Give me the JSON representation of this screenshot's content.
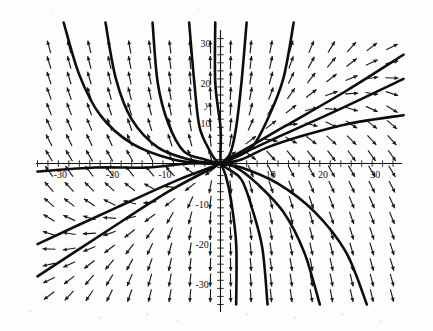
{
  "figure": {
    "kind": "direction-field-plot",
    "axis_name_y": "y",
    "background_color": "#fdfdfc",
    "ink_color": "#111111"
  },
  "chart_data": {
    "type": "scatter",
    "title": "",
    "subtitle": "",
    "xlabel": "",
    "ylabel": "y",
    "xlim": [
      -35,
      35
    ],
    "ylim": [
      -35,
      35
    ],
    "grid": false,
    "legend": null,
    "x_tick_labels": [
      "-30",
      "-20",
      "-10",
      "10",
      "20",
      "30"
    ],
    "x_tick_values": [
      -30,
      -20,
      -10,
      10,
      20,
      30
    ],
    "y_tick_labels": [
      "30",
      "20",
      "10",
      "-10",
      "-20",
      "-30"
    ],
    "y_tick_values": [
      30,
      20,
      10,
      -10,
      -20,
      -30
    ],
    "minor_tick_step": 2,
    "field": {
      "description": "slope field arrows on a regular grid",
      "grid_step_x": 4,
      "grid_step_y": 4,
      "arrow_count_x": 18,
      "arrow_count_y": 18,
      "arrow_length_px": 13
    },
    "equilibrium_points": [
      {
        "x": 0,
        "y": 0,
        "type": "node"
      }
    ],
    "solution_curves": [
      {
        "name": "separatrix-upper-right",
        "points": [
          [
            -35,
            -20
          ],
          [
            -20,
            -11
          ],
          [
            -8,
            -4
          ],
          [
            0,
            0
          ],
          [
            10,
            6
          ],
          [
            22,
            13
          ],
          [
            35,
            21
          ]
        ]
      },
      {
        "name": "separatrix-lower-left",
        "points": [
          [
            -35,
            -28
          ],
          [
            -22,
            -17
          ],
          [
            -10,
            -7
          ],
          [
            0,
            0
          ],
          [
            12,
            9
          ],
          [
            24,
            18
          ],
          [
            35,
            27
          ]
        ]
      },
      {
        "name": "curve-ul-1",
        "points": [
          [
            -30,
            35
          ],
          [
            -27,
            22
          ],
          [
            -23,
            12
          ],
          [
            -17,
            5
          ],
          [
            -9,
            1
          ],
          [
            -2,
            0
          ],
          [
            0,
            0
          ]
        ]
      },
      {
        "name": "curve-ul-2",
        "points": [
          [
            -22,
            35
          ],
          [
            -20,
            21
          ],
          [
            -17,
            11
          ],
          [
            -12,
            4
          ],
          [
            -6,
            1
          ],
          [
            -1,
            0
          ],
          [
            0,
            0
          ]
        ]
      },
      {
        "name": "curve-ul-3",
        "points": [
          [
            -13,
            35
          ],
          [
            -12,
            20
          ],
          [
            -10,
            10
          ],
          [
            -7,
            3
          ],
          [
            -3,
            1
          ],
          [
            0,
            0
          ]
        ]
      },
      {
        "name": "curve-ul-4",
        "points": [
          [
            -6,
            35
          ],
          [
            -5,
            20
          ],
          [
            -4,
            9
          ],
          [
            -2,
            3
          ],
          [
            -1,
            1
          ],
          [
            0,
            0
          ]
        ]
      },
      {
        "name": "curve-u-center",
        "points": [
          [
            -1,
            35
          ],
          [
            -1,
            20
          ],
          [
            0,
            9
          ],
          [
            0,
            3
          ],
          [
            0,
            0
          ]
        ]
      },
      {
        "name": "curve-ur-1",
        "points": [
          [
            5,
            35
          ],
          [
            4,
            20
          ],
          [
            3,
            9
          ],
          [
            2,
            3
          ],
          [
            1,
            1
          ],
          [
            0,
            0
          ]
        ]
      },
      {
        "name": "curve-ur-2",
        "points": [
          [
            14,
            35
          ],
          [
            12,
            21
          ],
          [
            9,
            11
          ],
          [
            6,
            4
          ],
          [
            2,
            1
          ],
          [
            0,
            0
          ]
        ]
      },
      {
        "name": "curve-r-flat",
        "points": [
          [
            35,
            12
          ],
          [
            25,
            10
          ],
          [
            16,
            7
          ],
          [
            9,
            4
          ],
          [
            4,
            1
          ],
          [
            0,
            0
          ]
        ]
      },
      {
        "name": "curve-lr-1",
        "points": [
          [
            3,
            -35
          ],
          [
            3,
            -20
          ],
          [
            2,
            -9
          ],
          [
            1,
            -3
          ],
          [
            0,
            0
          ]
        ]
      },
      {
        "name": "curve-lr-2",
        "points": [
          [
            9,
            -35
          ],
          [
            8,
            -21
          ],
          [
            6,
            -11
          ],
          [
            4,
            -4
          ],
          [
            1,
            -1
          ],
          [
            0,
            0
          ]
        ]
      },
      {
        "name": "curve-lr-3",
        "points": [
          [
            19,
            -35
          ],
          [
            16,
            -22
          ],
          [
            12,
            -12
          ],
          [
            7,
            -5
          ],
          [
            3,
            -1
          ],
          [
            0,
            0
          ]
        ]
      },
      {
        "name": "curve-lr-4",
        "points": [
          [
            28,
            -35
          ],
          [
            24,
            -22
          ],
          [
            18,
            -12
          ],
          [
            11,
            -5
          ],
          [
            4,
            -1
          ],
          [
            0,
            0
          ]
        ]
      },
      {
        "name": "curve-l-flat",
        "points": [
          [
            -35,
            -2
          ],
          [
            -24,
            -1
          ],
          [
            -14,
            -1
          ],
          [
            -6,
            0
          ],
          [
            0,
            0
          ]
        ]
      }
    ]
  }
}
